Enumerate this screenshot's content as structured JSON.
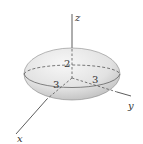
{
  "figure": {
    "type": "ellipsoid",
    "semi_axes": {
      "x": 3,
      "y": 3,
      "z": 2
    },
    "axes": [
      {
        "name": "x",
        "label": "x"
      },
      {
        "name": "y",
        "label": "y"
      },
      {
        "name": "z",
        "label": "z"
      }
    ],
    "intercept_labels": {
      "z": "2",
      "x": "3",
      "y": "3"
    },
    "colors": {
      "surface_light": "#f4f4f4",
      "surface_dark": "#bdbdbd",
      "line": "#333333"
    }
  }
}
